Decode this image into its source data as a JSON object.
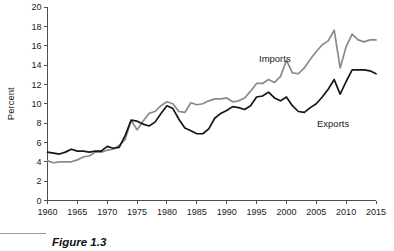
{
  "caption": {
    "label": "Figure 1.3"
  },
  "chart_data": {
    "type": "line",
    "title": "",
    "xlabel": "",
    "ylabel": "Percent",
    "xlim": [
      1960,
      2015
    ],
    "ylim": [
      0,
      20
    ],
    "grid": false,
    "legend_position": "inline-annotation",
    "xticks": [
      1960,
      1965,
      1970,
      1975,
      1980,
      1985,
      1990,
      1995,
      2000,
      2005,
      2010,
      2015
    ],
    "yticks": [
      0,
      2,
      4,
      6,
      8,
      10,
      12,
      14,
      16,
      18,
      20
    ],
    "x": [
      1960,
      1961,
      1962,
      1963,
      1964,
      1965,
      1966,
      1967,
      1968,
      1969,
      1970,
      1971,
      1972,
      1973,
      1974,
      1975,
      1976,
      1977,
      1978,
      1979,
      1980,
      1981,
      1982,
      1983,
      1984,
      1985,
      1986,
      1987,
      1988,
      1989,
      1990,
      1991,
      1992,
      1993,
      1994,
      1995,
      1996,
      1997,
      1998,
      1999,
      2000,
      2001,
      2002,
      2003,
      2004,
      2005,
      2006,
      2007,
      2008,
      2009,
      2010,
      2011,
      2012,
      2013,
      2014,
      2015
    ],
    "series": [
      {
        "name": "Imports",
        "color": "#8a8a8a",
        "annotation": "Imports",
        "values": [
          4.1,
          3.9,
          4.0,
          4.0,
          4.0,
          4.2,
          4.5,
          4.6,
          5.0,
          5.0,
          5.2,
          5.3,
          5.7,
          6.3,
          8.3,
          7.3,
          8.2,
          9.0,
          9.2,
          9.8,
          10.2,
          10.0,
          9.2,
          9.1,
          10.1,
          9.9,
          10.0,
          10.3,
          10.5,
          10.5,
          10.6,
          10.2,
          10.3,
          10.6,
          11.3,
          12.1,
          12.1,
          12.5,
          12.2,
          12.8,
          14.5,
          13.2,
          13.1,
          13.7,
          14.6,
          15.4,
          16.1,
          16.5,
          17.6,
          13.7,
          15.9,
          17.2,
          16.6,
          16.4,
          16.6,
          16.6
        ]
      },
      {
        "name": "Exports",
        "color": "#151515",
        "annotation": "Exports",
        "values": [
          5.0,
          4.9,
          4.8,
          5.0,
          5.3,
          5.1,
          5.1,
          5.0,
          5.1,
          5.1,
          5.6,
          5.4,
          5.5,
          6.7,
          8.3,
          8.2,
          7.9,
          7.7,
          8.1,
          9.0,
          9.8,
          9.5,
          8.4,
          7.5,
          7.2,
          6.9,
          6.9,
          7.4,
          8.5,
          9.0,
          9.3,
          9.7,
          9.6,
          9.4,
          9.8,
          10.7,
          10.8,
          11.2,
          10.6,
          10.3,
          10.7,
          9.8,
          9.2,
          9.1,
          9.6,
          10.0,
          10.7,
          11.5,
          12.5,
          11.0,
          12.3,
          13.5,
          13.5,
          13.5,
          13.4,
          13.1
        ]
      }
    ]
  }
}
